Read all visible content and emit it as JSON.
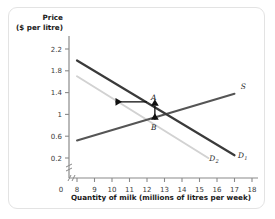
{
  "chart_data": {
    "type": "line",
    "title": "",
    "ylabel_line1": "Price",
    "ylabel_line2": "($ per litre)",
    "xlabel": "Quantity of milk (millions of litres per week)",
    "xlim": [
      8,
      18
    ],
    "ylim": [
      0,
      2.4
    ],
    "x_origin_label": "0",
    "xticks": [
      8,
      9,
      10,
      11,
      12,
      13,
      14,
      15,
      16,
      17,
      18
    ],
    "xtick_labels": [
      "8",
      "9",
      "10",
      "11",
      "12",
      "13",
      "14",
      "15",
      "16",
      "17",
      "18"
    ],
    "yticks": [
      0.2,
      0.6,
      1,
      1.4,
      1.8,
      2.2
    ],
    "ytick_labels": [
      "0.2",
      "0.6",
      "1",
      "1.4",
      "1.8",
      "2.2"
    ],
    "grid": false,
    "axis_break_x": true,
    "axis_break_y": true,
    "legend_position": "inline-curve-labels",
    "series": [
      {
        "name": "S",
        "label": "S",
        "label_sub": "",
        "role": "supply",
        "color": "#555555",
        "width": 2.0,
        "points": [
          [
            8,
            0.52
          ],
          [
            17,
            1.38
          ]
        ],
        "label_x": 17.35,
        "label_y": 1.47
      },
      {
        "name": "D1",
        "label": "D",
        "label_sub": "1",
        "role": "demand-original",
        "color": "#3a3a3a",
        "width": 2.2,
        "points": [
          [
            8,
            1.99
          ],
          [
            17,
            0.25
          ]
        ],
        "label_x": 17.2,
        "label_y": 0.2
      },
      {
        "name": "D2",
        "label": "D",
        "label_sub": "2",
        "role": "demand-shifted",
        "color": "#d2d2d2",
        "width": 2.0,
        "points": [
          [
            8,
            1.7
          ],
          [
            15.5,
            0.2
          ]
        ],
        "label_x": 15.55,
        "label_y": 0.14
      }
    ],
    "annotations": [
      {
        "name": "point-A",
        "label": "A",
        "x": 12.0,
        "y": 1.21,
        "label_dx": 4,
        "label_dy": -3
      },
      {
        "name": "point-B",
        "label": "B",
        "x": 12.0,
        "y": 0.88,
        "label_dx": 4,
        "label_dy": 9
      },
      {
        "name": "shift-arrow",
        "label": "",
        "type": "arrow-left",
        "from_x": 12.0,
        "from_y": 1.23,
        "to_x": 10.2,
        "to_y": 1.23
      },
      {
        "name": "price-gap-arrow",
        "label": "",
        "type": "arrow-vertical-double",
        "x": 12.45,
        "from_y": 1.16,
        "to_y": 0.9
      }
    ]
  }
}
